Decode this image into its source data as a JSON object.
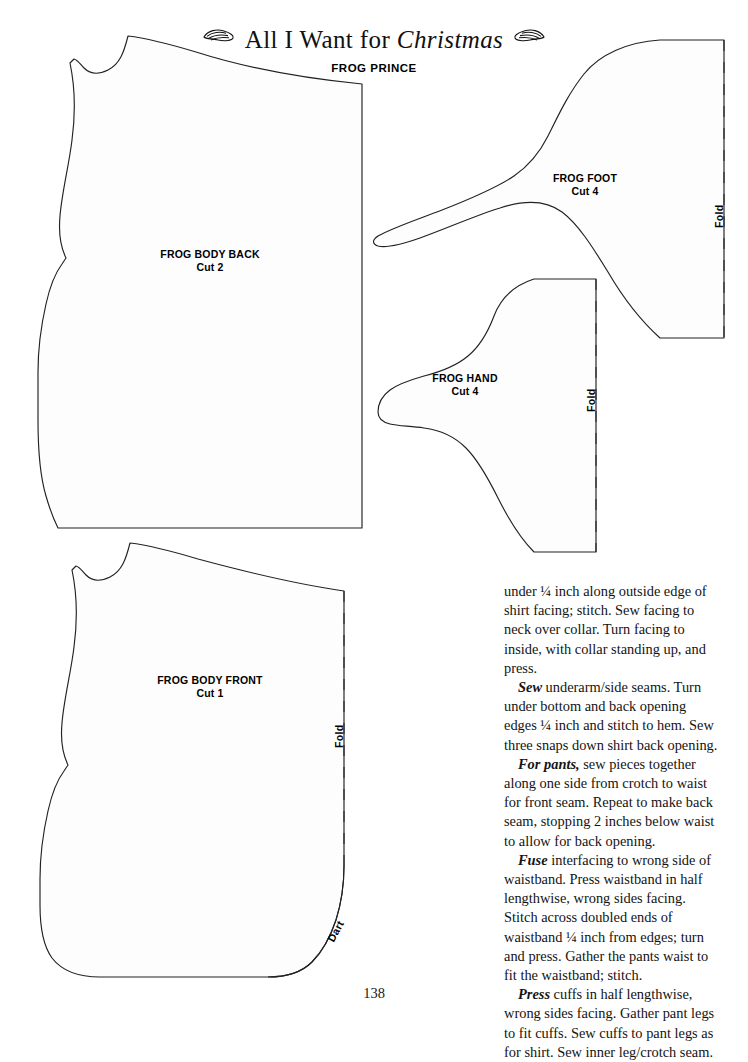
{
  "header": {
    "title_plain_start": "All I Want for ",
    "title_italic": "Christmas",
    "flourish_icon": "leaf-swirl-ornament",
    "pattern_set": "FROG PRINCE"
  },
  "pattern_pieces": [
    {
      "id": "frog-body-back",
      "name": "FROG BODY BACK",
      "cut": "Cut 2",
      "fold": null,
      "dart": null
    },
    {
      "id": "frog-foot",
      "name": "FROG FOOT",
      "cut": "Cut 4",
      "fold": "Fold",
      "dart": null
    },
    {
      "id": "frog-hand",
      "name": "FROG HAND",
      "cut": "Cut 4",
      "fold": "Fold",
      "dart": null
    },
    {
      "id": "frog-body-front",
      "name": "FROG BODY FRONT",
      "cut": "Cut 1",
      "fold": "Fold",
      "dart": "Dart"
    }
  ],
  "instructions": {
    "paragraphs": [
      {
        "lead": "",
        "text": "under ¼ inch along outside edge of shirt facing; stitch. Sew facing to neck over collar. Turn facing to inside, with collar standing up, and press.",
        "indent": false
      },
      {
        "lead": "Sew",
        "text": " underarm/side seams. Turn under bottom and back opening edges ¼ inch and stitch to hem. Sew three snaps down shirt back opening.",
        "indent": true
      },
      {
        "lead": "For pants,",
        "text": " sew pieces together along one side from crotch to waist for front seam. Repeat to make back seam, stopping 2 inches below waist to allow for back opening.",
        "indent": true
      },
      {
        "lead": "Fuse",
        "text": " interfacing to wrong side of waistband. Press waistband in half lengthwise, wrong sides facing. Stitch across doubled ends of waistband ¼ inch from edges; turn and press. Gather the pants waist to fit the waistband; stitch.",
        "indent": true
      },
      {
        "lead": "Press",
        "text": " cuffs in half lengthwise, wrong sides facing. Gather pant legs to fit cuffs. Sew cuffs to pant legs as for shirt. Sew inner leg/crotch seam.",
        "indent": true
      }
    ]
  },
  "page_number": "138",
  "colors": {
    "ink": "#111111",
    "outline": "#222222",
    "fold_dash": "#3a3a3a",
    "paper": "#ffffff"
  }
}
